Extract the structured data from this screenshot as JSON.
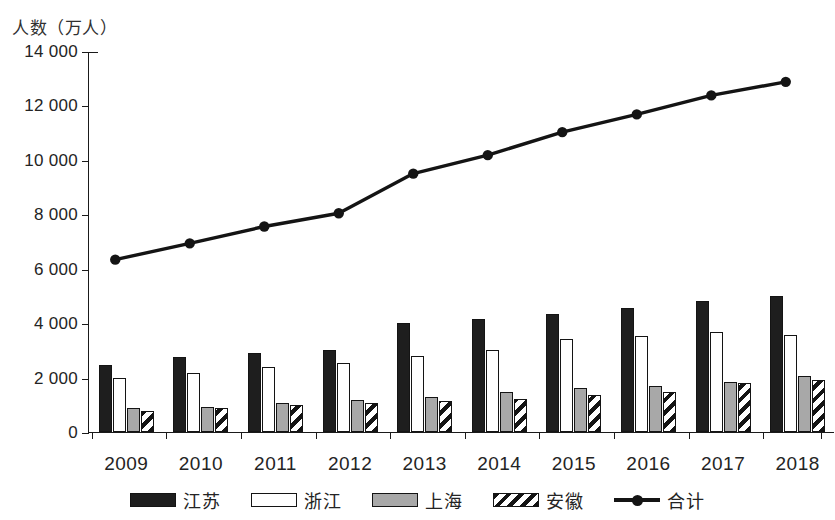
{
  "chart_data": {
    "type": "bar",
    "title": "",
    "subtitle": "",
    "ylabel": "人数（万人）",
    "xlabel": "",
    "categories": [
      "2009",
      "2010",
      "2011",
      "2012",
      "2013",
      "2014",
      "2015",
      "2016",
      "2017",
      "2018"
    ],
    "ylim": [
      0,
      14000
    ],
    "ytick_labels": [
      "0",
      "2 000",
      "4 000",
      "6 000",
      "8 000",
      "10 000",
      "12 000",
      "14 000"
    ],
    "ytick_values": [
      0,
      2000,
      4000,
      6000,
      8000,
      10000,
      12000,
      14000
    ],
    "grid": false,
    "legend_position": "bottom",
    "series": [
      {
        "name": "江苏",
        "kind": "bar",
        "style": "solid-black",
        "color": "#1e1e1e",
        "values": [
          2450,
          2750,
          2900,
          3020,
          4000,
          4150,
          4320,
          4550,
          4800,
          5000
        ]
      },
      {
        "name": "浙江",
        "kind": "bar",
        "style": "hollow-white",
        "color": "#ffffff",
        "values": [
          1990,
          2160,
          2400,
          2530,
          2800,
          3000,
          3430,
          3530,
          3680,
          3550
        ]
      },
      {
        "name": "上海",
        "kind": "bar",
        "style": "solid-gray",
        "color": "#a8a8a8",
        "values": [
          880,
          920,
          1050,
          1180,
          1280,
          1470,
          1600,
          1680,
          1850,
          2050
        ]
      },
      {
        "name": "安徽",
        "kind": "bar",
        "style": "diagonal-hatch",
        "color": "#141414",
        "values": [
          780,
          880,
          1000,
          1050,
          1150,
          1220,
          1350,
          1480,
          1800,
          1900
        ]
      },
      {
        "name": "合计",
        "kind": "line",
        "style": "line-with-round-markers",
        "color": "#141414",
        "values": [
          6350,
          6950,
          7570,
          8060,
          9520,
          10200,
          11050,
          11700,
          12400,
          12900
        ]
      }
    ]
  },
  "legend": {
    "items": [
      {
        "label": "江苏",
        "swatch": "solid-black"
      },
      {
        "label": "浙江",
        "swatch": "hollow-white"
      },
      {
        "label": "上海",
        "swatch": "solid-gray"
      },
      {
        "label": "安徽",
        "swatch": "diagonal-hatch"
      },
      {
        "label": "合计",
        "swatch": "line-marker"
      }
    ]
  }
}
